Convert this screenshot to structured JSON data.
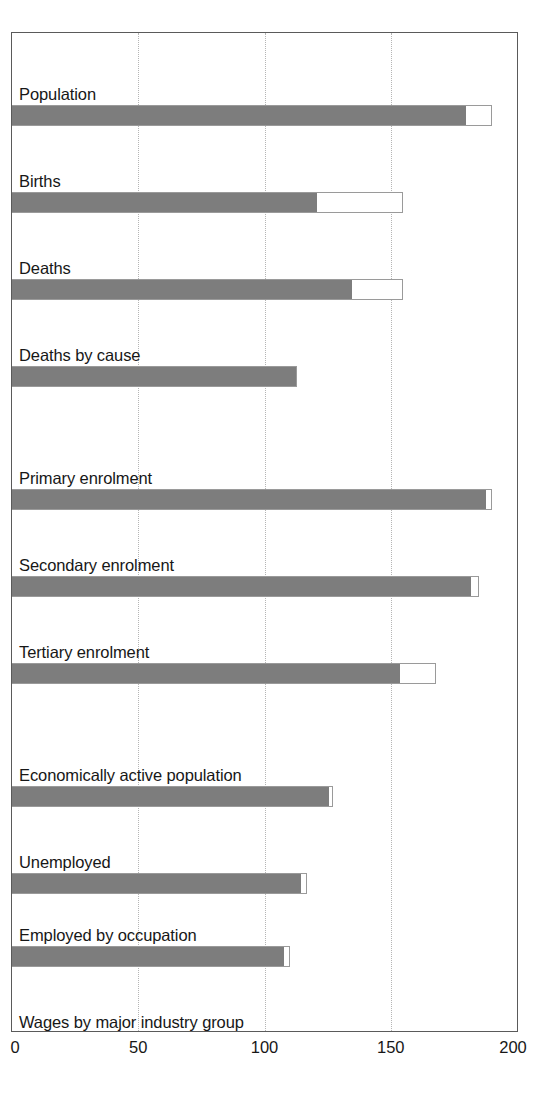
{
  "chart_data": {
    "type": "bar",
    "orientation": "horizontal",
    "title": "",
    "subtitle": "",
    "xlabel": "",
    "ylabel": "",
    "xlim": [
      0,
      200
    ],
    "xticks": [
      0,
      50,
      100,
      150,
      200
    ],
    "xtick_labels": [
      "0",
      "50",
      "100",
      "150",
      "200"
    ],
    "grid": {
      "vertical": true,
      "horizontal": false,
      "style": "dotted"
    },
    "legend": {
      "show": false,
      "position": "none"
    },
    "series": [
      {
        "name": "Filled",
        "key": "value",
        "color": "#7d7d7d"
      },
      {
        "name": "Outline total",
        "key": "total",
        "color": "#ffffff"
      }
    ],
    "categories": [
      "Population",
      "Births",
      "Deaths",
      "Deaths by cause",
      "Primary enrolment",
      "Secondary enrolment",
      "Tertiary enrolment",
      "Economically active population",
      "Unemployed",
      "Employed by occupation",
      "Wages by major industry group"
    ],
    "values": [
      180,
      121,
      135,
      113,
      188,
      182,
      154,
      126,
      115,
      108,
      53
    ],
    "totals": [
      190,
      155,
      155,
      113,
      190,
      185,
      168,
      127,
      117,
      110,
      111
    ],
    "bars": [
      {
        "label": "Population",
        "value": 180,
        "total": 190
      },
      {
        "label": "Births",
        "value": 121,
        "total": 155
      },
      {
        "label": "Deaths",
        "value": 135,
        "total": 155
      },
      {
        "label": "Deaths by cause",
        "value": 113,
        "total": 113
      },
      {
        "label": "Primary enrolment",
        "value": 188,
        "total": 190
      },
      {
        "label": "Secondary enrolment",
        "value": 182,
        "total": 185
      },
      {
        "label": "Tertiary enrolment",
        "value": 154,
        "total": 168
      },
      {
        "label": "Economically active population",
        "value": 126,
        "total": 127
      },
      {
        "label": "Unemployed",
        "value": 115,
        "total": 117
      },
      {
        "label": "Employed by occupation",
        "value": 108,
        "total": 110
      },
      {
        "label": "Wages by major industry group",
        "value": 53,
        "total": 111
      }
    ],
    "colors": {
      "bar_fill": "#7d7d7d",
      "bar_outline": "#9a9a9a",
      "frame": "#5a5a5a",
      "gridline": "#b5b5b5",
      "text": "#171717",
      "background": "#ffffff"
    }
  }
}
